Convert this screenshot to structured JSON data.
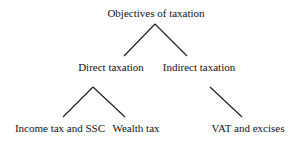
{
  "diagram": {
    "type": "tree",
    "root": {
      "label": "Objectives of taxation",
      "children": [
        {
          "label": "Direct taxation",
          "children": [
            {
              "label": "Income tax and SSC"
            },
            {
              "label": "Wealth tax"
            }
          ]
        },
        {
          "label": "Indirect taxation",
          "children": [
            {
              "label": "VAT and excises"
            }
          ]
        }
      ]
    },
    "nodes": {
      "objectives": "Objectives of taxation",
      "direct": "Direct taxation",
      "indirect": "Indirect taxation",
      "income": "Income tax and SSC",
      "wealth": "Wealth tax",
      "vat": "VAT and excises"
    },
    "colors": {
      "line": "#1a1a1a",
      "text": "#111111",
      "background": "#ffffff"
    }
  }
}
